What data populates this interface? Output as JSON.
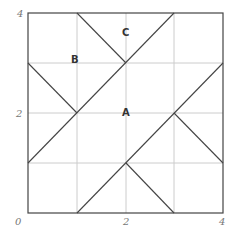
{
  "diagram": {
    "type": "grid-geometry",
    "grid": {
      "xmin": 0,
      "xmax": 4,
      "ymin": 0,
      "ymax": 4,
      "step": 1
    },
    "tick_labels": {
      "x": [
        {
          "value": 0,
          "label": "0"
        },
        {
          "value": 2,
          "label": "2"
        },
        {
          "value": 4,
          "label": "4"
        }
      ],
      "y": [
        {
          "value": 2,
          "label": "2"
        },
        {
          "value": 4,
          "label": "4"
        }
      ]
    },
    "points": [
      {
        "label": "A",
        "x": 2,
        "y": 2
      },
      {
        "label": "B",
        "x": 1,
        "y": 3
      },
      {
        "label": "C",
        "x": 2,
        "y": 3.6
      }
    ],
    "segments": [
      {
        "from": [
          1,
          4
        ],
        "to": [
          2,
          3
        ]
      },
      {
        "from": [
          3,
          4
        ],
        "to": [
          0,
          1
        ]
      },
      {
        "from": [
          0,
          3
        ],
        "to": [
          1,
          2
        ]
      },
      {
        "from": [
          4,
          3
        ],
        "to": [
          1,
          0
        ]
      },
      {
        "from": [
          3,
          2
        ],
        "to": [
          4,
          1
        ]
      },
      {
        "from": [
          2,
          1
        ],
        "to": [
          3,
          0
        ]
      }
    ],
    "colors": {
      "border": "#444444",
      "grid": "#cccccc",
      "segment": "#444444",
      "tick": "#777777",
      "label": "#333333"
    }
  }
}
